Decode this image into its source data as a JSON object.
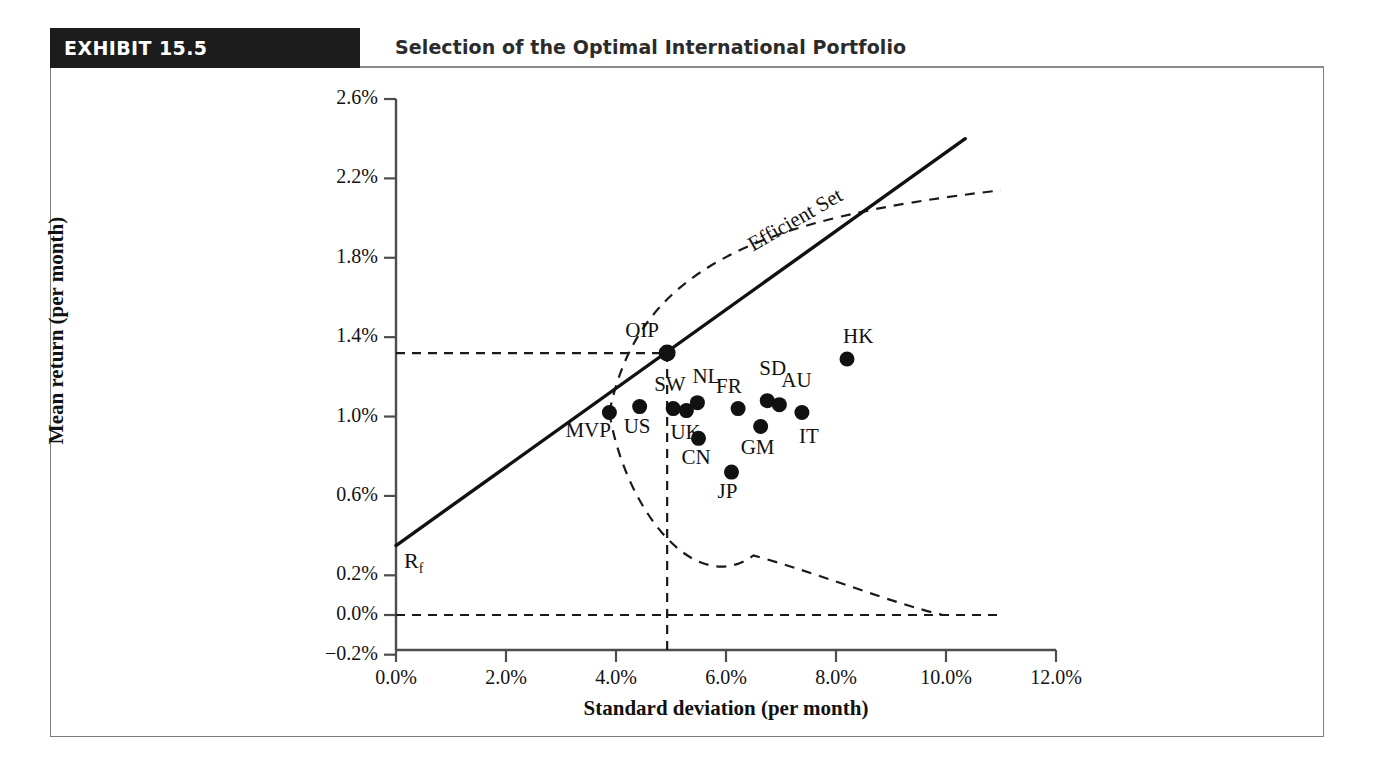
{
  "exhibit": {
    "tag": "EXHIBIT 15.5",
    "title": "Selection of the Optimal International Portfolio"
  },
  "chart_data": {
    "type": "scatter",
    "title": "Selection of the Optimal International Portfolio",
    "xlabel": "Standard deviation (per month)",
    "ylabel": "Mean return (per month)",
    "xlim": [
      0.0,
      12.0
    ],
    "ylim": [
      -0.2,
      2.6
    ],
    "xticks": [
      "0.0%",
      "2.0%",
      "4.0%",
      "6.0%",
      "8.0%",
      "10.0%",
      "12.0%"
    ],
    "xtick_values": [
      0.0,
      2.0,
      4.0,
      6.0,
      8.0,
      10.0,
      12.0
    ],
    "yticks": [
      "2.6%",
      "2.2%",
      "1.8%",
      "1.4%",
      "1.0%",
      "0.6%",
      "0.2%",
      "0.0%",
      "−0.2%"
    ],
    "ytick_values": [
      2.6,
      2.2,
      1.8,
      1.4,
      1.0,
      0.6,
      0.2,
      0.0,
      -0.2
    ],
    "grid": false,
    "legend": null,
    "points": [
      {
        "label": "MVP",
        "x": 3.88,
        "y": 1.02,
        "label_dx": -44,
        "label_dy": 16
      },
      {
        "label": "US",
        "x": 4.43,
        "y": 1.05,
        "label_dx": -16,
        "label_dy": 18
      },
      {
        "label": "SW",
        "x": 5.04,
        "y": 1.04,
        "label_dx": -19,
        "label_dy": -26
      },
      {
        "label": "UK",
        "x": 5.28,
        "y": 1.03,
        "label_dx": -16,
        "label_dy": 20
      },
      {
        "label": "NL",
        "x": 5.48,
        "y": 1.07,
        "label_dx": -5,
        "label_dy": -28
      },
      {
        "label": "CN",
        "x": 5.5,
        "y": 0.89,
        "label_dx": -17,
        "label_dy": 18
      },
      {
        "label": "JP",
        "x": 6.1,
        "y": 0.72,
        "label_dx": -14,
        "label_dy": 18
      },
      {
        "label": "FR",
        "x": 6.22,
        "y": 1.04,
        "label_dx": -22,
        "label_dy": -24
      },
      {
        "label": "GM",
        "x": 6.63,
        "y": 0.95,
        "label_dx": -20,
        "label_dy": 20
      },
      {
        "label": "SD",
        "x": 6.75,
        "y": 1.08,
        "label_dx": -8,
        "label_dy": -34
      },
      {
        "label": "AU",
        "x": 6.97,
        "y": 1.06,
        "label_dx": 2,
        "label_dy": -26
      },
      {
        "label": "IT",
        "x": 7.38,
        "y": 1.02,
        "label_dx": -3,
        "label_dy": 22
      },
      {
        "label": "HK",
        "x": 8.2,
        "y": 1.29,
        "label_dx": -4,
        "label_dy": -24
      },
      {
        "label": "OIP",
        "x": 4.93,
        "y": 1.32,
        "label_dx": -42,
        "label_dy": -24
      }
    ],
    "annotations": [
      {
        "name": "efficient-set",
        "text": "Efficient Set"
      },
      {
        "name": "risk-free-rate",
        "text": "R",
        "sub": "f",
        "value": 0.35
      }
    ],
    "lines": {
      "capital_market_line": {
        "from": [
          0.0,
          0.35
        ],
        "to": [
          10.35,
          2.4
        ],
        "style": "solid",
        "label": "Efficient Set"
      },
      "guide_horizontal_oip": {
        "y": 1.32,
        "from_x": 0.0,
        "to_x": 4.93,
        "style": "dashed"
      },
      "guide_vertical_oip": {
        "x": 4.93,
        "from_y": 1.32,
        "to_y": -0.2,
        "style": "dashed"
      },
      "zero_line": {
        "y": 0.0,
        "from_x": 0.0,
        "to_x": 11.0,
        "style": "dashed"
      },
      "efficient_frontier": {
        "style": "dashed",
        "note": "Hyperbolic envelope of feasible portfolios"
      }
    }
  }
}
